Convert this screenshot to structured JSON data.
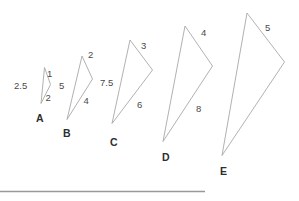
{
  "figure": {
    "background_color": "#ffffff",
    "stroke_color": "#a8a8a8",
    "label_color": "#3a3a3a",
    "rule_color": "#999999"
  },
  "triangles": [
    {
      "name": "A",
      "vertex_label": "A",
      "vertex_label_x": 36,
      "vertex_label_y": 113,
      "points": "44.5,67.5 50.5,84.5 41,103.5",
      "side_labels": [
        {
          "text": "2.5",
          "x": 14,
          "y": 81,
          "name": "side-label-a-left"
        },
        {
          "text": "1",
          "x": 47,
          "y": 69,
          "name": "side-label-a-top"
        },
        {
          "text": "2",
          "x": 45.5,
          "y": 93,
          "name": "side-label-a-bottom"
        }
      ]
    },
    {
      "name": "B",
      "vertex_label": "B",
      "vertex_label_x": 63,
      "vertex_label_y": 128,
      "points": "82,56 92.5,79 67,119.5",
      "side_labels": [
        {
          "text": "5",
          "x": 59,
          "y": 81,
          "name": "side-label-b-left"
        },
        {
          "text": "2",
          "x": 88,
          "y": 50,
          "name": "side-label-b-top"
        },
        {
          "text": "4",
          "x": 83.5,
          "y": 96,
          "name": "side-label-b-bottom"
        }
      ]
    },
    {
      "name": "C",
      "vertex_label": "C",
      "vertex_label_x": 110,
      "vertex_label_y": 137,
      "points": "130,40 152.5,70 112,123.5",
      "side_labels": [
        {
          "text": "7.5",
          "x": 100,
          "y": 78,
          "name": "side-label-c-left"
        },
        {
          "text": "3",
          "x": 141,
          "y": 41,
          "name": "side-label-c-top"
        },
        {
          "text": "6",
          "x": 137,
          "y": 100,
          "name": "side-label-c-bottom"
        }
      ]
    },
    {
      "name": "D",
      "vertex_label": "D",
      "vertex_label_x": 162,
      "vertex_label_y": 152,
      "points": "185,26 212.5,66 163,141.5",
      "side_labels": [
        {
          "text": "4",
          "x": 201,
          "y": 28,
          "name": "side-label-d-top"
        },
        {
          "text": "8",
          "x": 196,
          "y": 104,
          "name": "side-label-d-bottom"
        }
      ]
    },
    {
      "name": "E",
      "vertex_label": "E",
      "vertex_label_x": 220,
      "vertex_label_y": 166,
      "points": "247,13 284.5,62 222,155.5",
      "side_labels": [
        {
          "text": "5",
          "x": 265,
          "y": 23,
          "name": "side-label-e-top"
        }
      ]
    }
  ],
  "rule": {
    "name": "horizontal-rule",
    "x1": 0,
    "y1": 191.5,
    "x2": 205,
    "y2": 191.5
  }
}
